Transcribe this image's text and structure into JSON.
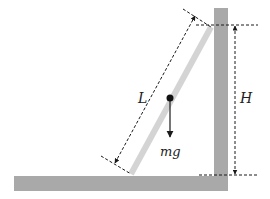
{
  "diagram": {
    "labels": {
      "length": "L",
      "height": "H",
      "weight": "mg"
    },
    "colors": {
      "surface": "#a9a9a9",
      "ladder": "#d4d4d4",
      "ink": "#1a1a1a",
      "background": "#ffffff"
    },
    "elements": {
      "floor": "floor",
      "wall": "wall",
      "ladder": "ladder",
      "center_of_mass": "center-of-mass",
      "weight_vector": "weight-arrow",
      "length_dimension": "length-dimension",
      "height_dimension": "height-dimension"
    }
  }
}
